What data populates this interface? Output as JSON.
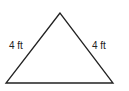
{
  "diagram": {
    "shape": "isosceles-triangle",
    "stroke_color": "#222222",
    "vertices": {
      "apex": [
        60,
        13
      ],
      "bottom_left": [
        6,
        83
      ],
      "bottom_right": [
        113,
        83
      ]
    },
    "labels": {
      "left_side": "4 ft",
      "right_side": "4 ft"
    }
  }
}
